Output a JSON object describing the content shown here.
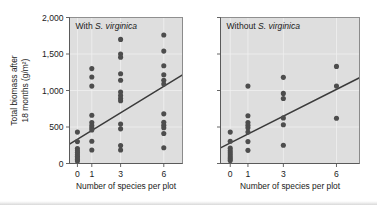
{
  "figure": {
    "background_color": "#ffffff",
    "panel_background_color": "#dedede",
    "dot_color": "#4d4d4d",
    "line_color": "#3b3b3b",
    "gridline_color": "#f0f0f0"
  },
  "axes": {
    "y_label_line1": "Total biomass after",
    "y_label_line2": "18 months (g/m²)",
    "y_ticks": [
      "0",
      "500",
      "1,000",
      "1,500",
      "2,000"
    ],
    "y_tick_values": [
      0,
      500,
      1000,
      1500,
      2000
    ],
    "y_min": 0,
    "y_max": 2000,
    "x_label": "Number of species per plot",
    "x_ticks": [
      "0",
      "1",
      "3",
      "6"
    ],
    "x_tick_values": [
      0,
      1,
      3,
      6
    ],
    "x_min": -0.55,
    "x_max": 7.3
  },
  "panels": [
    {
      "title_prefix": "With ",
      "title_species": "S. virginica",
      "name": "with-s-virginica"
    },
    {
      "title_prefix": "Without ",
      "title_species": "S. virginica",
      "name": "without-s-virginica"
    }
  ],
  "chart_data": {
    "type": "scatter",
    "title": "",
    "xlabel": "Number of species per plot",
    "ylabel": "Total biomass after 18 months (g/m²)",
    "xlim": [
      -0.55,
      7.3
    ],
    "ylim": [
      0,
      2000
    ],
    "xticks": [
      0,
      1,
      3,
      6
    ],
    "yticks": [
      0,
      500,
      1000,
      1500,
      2000
    ],
    "grid": true,
    "legend": "none",
    "panels": [
      {
        "name": "With S. virginica",
        "points": [
          {
            "x": 0,
            "y": 430
          },
          {
            "x": 0,
            "y": 300
          },
          {
            "x": 0,
            "y": 205
          },
          {
            "x": 0,
            "y": 175
          },
          {
            "x": 0,
            "y": 150
          },
          {
            "x": 0,
            "y": 125
          },
          {
            "x": 0,
            "y": 100
          },
          {
            "x": 0,
            "y": 75
          },
          {
            "x": 0,
            "y": 55
          },
          {
            "x": 0,
            "y": 35
          },
          {
            "x": 1,
            "y": 1300
          },
          {
            "x": 1,
            "y": 1185
          },
          {
            "x": 1,
            "y": 1060
          },
          {
            "x": 1,
            "y": 660
          },
          {
            "x": 1,
            "y": 560
          },
          {
            "x": 1,
            "y": 520
          },
          {
            "x": 1,
            "y": 490
          },
          {
            "x": 1,
            "y": 460
          },
          {
            "x": 1,
            "y": 305
          },
          {
            "x": 1,
            "y": 185
          },
          {
            "x": 3,
            "y": 1700
          },
          {
            "x": 3,
            "y": 1500
          },
          {
            "x": 3,
            "y": 1455
          },
          {
            "x": 3,
            "y": 1230
          },
          {
            "x": 3,
            "y": 1140
          },
          {
            "x": 3,
            "y": 980
          },
          {
            "x": 3,
            "y": 930
          },
          {
            "x": 3,
            "y": 890
          },
          {
            "x": 3,
            "y": 860
          },
          {
            "x": 3,
            "y": 540
          },
          {
            "x": 3,
            "y": 475
          },
          {
            "x": 3,
            "y": 245
          },
          {
            "x": 3,
            "y": 185
          },
          {
            "x": 6,
            "y": 1760
          },
          {
            "x": 6,
            "y": 1540
          },
          {
            "x": 6,
            "y": 1340
          },
          {
            "x": 6,
            "y": 1215
          },
          {
            "x": 6,
            "y": 1140
          },
          {
            "x": 6,
            "y": 1090
          },
          {
            "x": 6,
            "y": 680
          },
          {
            "x": 6,
            "y": 565
          },
          {
            "x": 6,
            "y": 525
          },
          {
            "x": 6,
            "y": 490
          },
          {
            "x": 6,
            "y": 410
          },
          {
            "x": 6,
            "y": 215
          }
        ],
        "fit_line": {
          "x1": -0.55,
          "y1": 265,
          "x2": 7.3,
          "y2": 1215
        }
      },
      {
        "name": "Without S. virginica",
        "points": [
          {
            "x": 0,
            "y": 430
          },
          {
            "x": 0,
            "y": 305
          },
          {
            "x": 0,
            "y": 210
          },
          {
            "x": 0,
            "y": 175
          },
          {
            "x": 0,
            "y": 145
          },
          {
            "x": 0,
            "y": 115
          },
          {
            "x": 0,
            "y": 90
          },
          {
            "x": 0,
            "y": 65
          },
          {
            "x": 0,
            "y": 40
          },
          {
            "x": 1,
            "y": 1060
          },
          {
            "x": 1,
            "y": 655
          },
          {
            "x": 1,
            "y": 560
          },
          {
            "x": 1,
            "y": 525
          },
          {
            "x": 1,
            "y": 490
          },
          {
            "x": 1,
            "y": 430
          },
          {
            "x": 1,
            "y": 300
          },
          {
            "x": 1,
            "y": 180
          },
          {
            "x": 3,
            "y": 1180
          },
          {
            "x": 3,
            "y": 960
          },
          {
            "x": 3,
            "y": 890
          },
          {
            "x": 3,
            "y": 625
          },
          {
            "x": 3,
            "y": 530
          },
          {
            "x": 3,
            "y": 250
          },
          {
            "x": 6,
            "y": 1330
          },
          {
            "x": 6,
            "y": 1060
          },
          {
            "x": 6,
            "y": 620
          }
        ],
        "fit_line": {
          "x1": -0.55,
          "y1": 215,
          "x2": 7.3,
          "y2": 1175
        }
      }
    ]
  }
}
